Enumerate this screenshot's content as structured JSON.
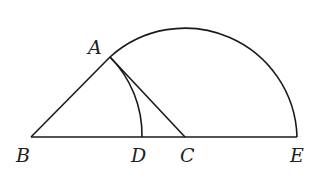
{
  "diagram": {
    "points": {
      "A": {
        "label": "A",
        "x": 110,
        "y": 57
      },
      "B": {
        "label": "B",
        "x": 31,
        "y": 137
      },
      "C": {
        "label": "C",
        "x": 185,
        "y": 137
      },
      "D": {
        "label": "D",
        "x": 142,
        "y": 137
      },
      "E": {
        "label": "E",
        "x": 297,
        "y": 137
      }
    },
    "segments": [
      "AB",
      "AC",
      "BE"
    ],
    "arcs": [
      {
        "name": "arc-AE",
        "center": "C",
        "from": "A",
        "to": "E"
      },
      {
        "name": "arc-AD",
        "center": "B",
        "from": "A",
        "to": "D"
      }
    ],
    "labels": [
      "A",
      "B",
      "C",
      "D",
      "E"
    ]
  }
}
